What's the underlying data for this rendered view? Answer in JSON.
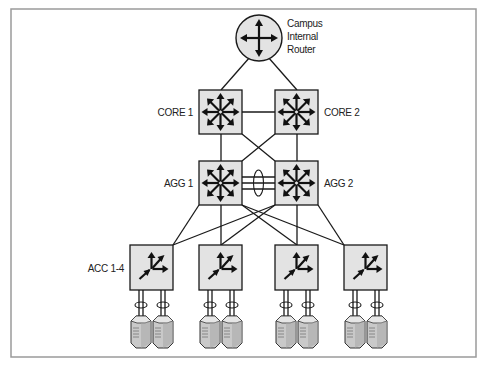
{
  "diagram": {
    "colors": {
      "device_fill": "#e3e3e3",
      "stroke": "#1a1a1a",
      "frame": "#9a9a9a",
      "server_light": "#d4d4d4",
      "server_dark": "#a8a8a8"
    },
    "nodes": {
      "router": {
        "label_lines": [
          "Campus",
          "Internal",
          "Router"
        ],
        "icon": "router-icon"
      },
      "core1": {
        "label": "CORE 1",
        "icon": "multilayer-switch-icon"
      },
      "core2": {
        "label": "CORE 2",
        "icon": "multilayer-switch-icon"
      },
      "agg1": {
        "label": "AGG 1",
        "icon": "multilayer-switch-icon"
      },
      "agg2": {
        "label": "AGG 2",
        "icon": "multilayer-switch-icon"
      },
      "acc_group": {
        "label": "ACC 1-4",
        "icon": "access-switch-icon",
        "count": 4
      },
      "servers": {
        "count": 8,
        "icon": "server-icon",
        "per_switch": 2
      }
    },
    "edges": [
      [
        "router",
        "core1"
      ],
      [
        "router",
        "core2"
      ],
      [
        "core1",
        "core2"
      ],
      [
        "core1",
        "agg1"
      ],
      [
        "core1",
        "agg2"
      ],
      [
        "core2",
        "agg1"
      ],
      [
        "core2",
        "agg2"
      ],
      [
        "agg1",
        "agg2",
        "port-channel x3"
      ],
      [
        "agg1",
        "acc1"
      ],
      [
        "agg1",
        "acc2"
      ],
      [
        "agg1",
        "acc3"
      ],
      [
        "agg1",
        "acc4"
      ],
      [
        "agg2",
        "acc1"
      ],
      [
        "agg2",
        "acc2"
      ],
      [
        "agg2",
        "acc3"
      ],
      [
        "agg2",
        "acc4"
      ]
    ]
  }
}
